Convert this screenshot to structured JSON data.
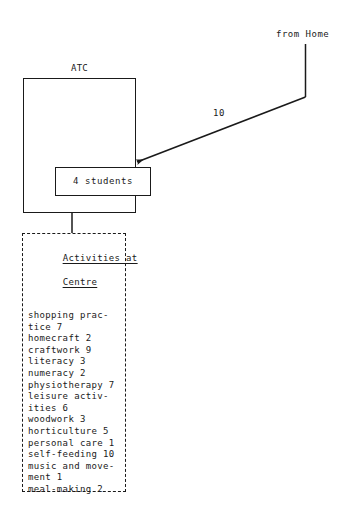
{
  "diagram": {
    "background_color": "#ffffff",
    "ink_color": "#1a1a1a",
    "nodes": {
      "atc": {
        "label": "ATC",
        "inner_label": "4 students"
      },
      "note": {
        "heading_line1": "Activities at",
        "heading_line2": "Centre",
        "items": [
          "shopping prac-",
          "tice 7",
          "homecraft 2",
          "craftwork 9",
          "literacy 3",
          "numeracy 2",
          "physiotherapy 7",
          "leisure activ-",
          "ities 6",
          "woodwork 3",
          "horticulture 5",
          "personal care 1",
          "self-feeding 10",
          "music and move-",
          "ment 1",
          "meal-making 2"
        ]
      }
    },
    "edges": {
      "from_home": {
        "source_label": "from Home",
        "flow_label": "10"
      }
    }
  }
}
